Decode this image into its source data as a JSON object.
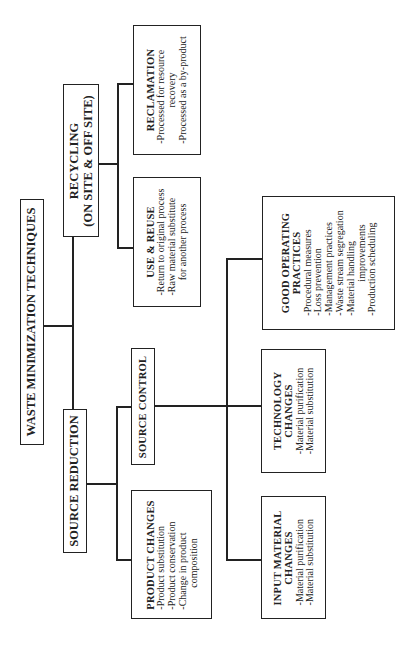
{
  "diagram": {
    "title": "WASTE MINIMIZATION TECHNIQUES",
    "branches": {
      "recycling": {
        "label_line1": "RECYCLING",
        "label_line2": "(ON SITE & OFF SITE)",
        "children": {
          "use_reuse": {
            "title": "USE & REUSE",
            "items": [
              "-Return to original process",
              "-Raw material substitute",
              "for another process"
            ]
          },
          "reclamation": {
            "title": "RECLAMATION",
            "items": [
              "-Processed for resource",
              "recovery",
              "-Processed as a by-product"
            ]
          }
        }
      },
      "source_reduction": {
        "label": "SOURCE REDUCTION",
        "children": {
          "product_changes": {
            "title": "PRODUCT CHANGES",
            "items": [
              "-Product substitution",
              "-Product conservation",
              "-Change in product",
              "composition"
            ]
          },
          "source_control": {
            "label": "SOURCE CONTROL",
            "children": {
              "input_material": {
                "title_line1": "INPUT MATERIAL",
                "title_line2": "CHANGES",
                "items": [
                  "-Material purification",
                  "-Material substitution"
                ]
              },
              "technology": {
                "title_line1": "TECHNOLOGY",
                "title_line2": "CHANGES",
                "items": [
                  "-Material purification",
                  "-Material substitution"
                ]
              },
              "good_operating": {
                "title_line1": "GOOD OPERATING",
                "title_line2": "PRACTICES",
                "items": [
                  "-Procedural measures",
                  "-Loss prevention",
                  "-Management practices",
                  "-Waste stream segregation",
                  "-Material handling",
                  "improvements",
                  "-Production scheduling"
                ]
              }
            }
          }
        }
      }
    }
  }
}
